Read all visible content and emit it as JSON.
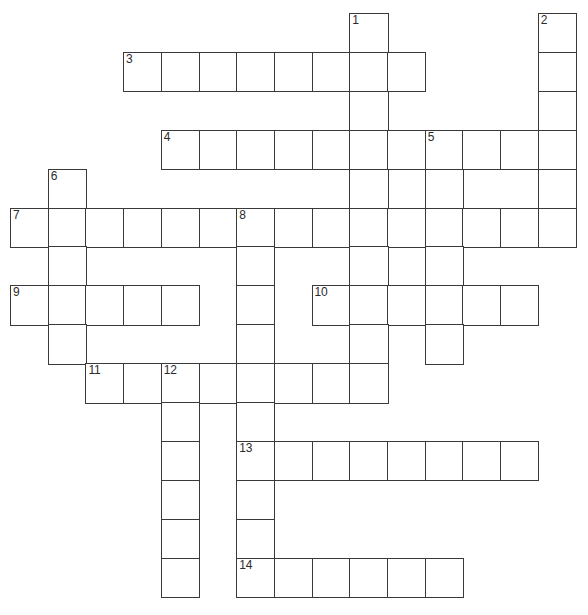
{
  "puzzle": {
    "title": "Crossword Puzzle Grid",
    "kind": "crossword-grid",
    "canvas": {
      "width": 588,
      "height": 615
    },
    "geometry": {
      "origin_x": 10,
      "origin_y": 13,
      "cell_width": 37.7,
      "cell_height": 38.9,
      "columns": 15,
      "rows": 16
    },
    "colors": {
      "background": "#ffffff",
      "cell_fill": "#ffffff",
      "cell_border": "#3a3a3a",
      "number_text": "#2b2b2b"
    },
    "numbered_clues": [
      {
        "number": "1",
        "col": 9,
        "row": 0,
        "direction": "down",
        "length": 10
      },
      {
        "number": "2",
        "col": 14,
        "row": 0,
        "direction": "down",
        "length": 6
      },
      {
        "number": "3",
        "col": 3,
        "row": 1,
        "direction": "across",
        "length": 8
      },
      {
        "number": "4",
        "col": 4,
        "row": 3,
        "direction": "across",
        "length": 7
      },
      {
        "number": "5",
        "col": 11,
        "row": 3,
        "direction": "across",
        "length": 4
      },
      {
        "number": "6",
        "col": 1,
        "row": 4,
        "direction": "down",
        "length": 6
      },
      {
        "number": "7",
        "col": 0,
        "row": 5,
        "direction": "across",
        "length": 15
      },
      {
        "number": "8",
        "col": 6,
        "row": 5,
        "direction": "down",
        "length": 10
      },
      {
        "number": "9",
        "col": 0,
        "row": 7,
        "direction": "across",
        "length": 5
      },
      {
        "number": "10",
        "col": 8,
        "row": 7,
        "direction": "across",
        "length": 6
      },
      {
        "number": "11",
        "col": 2,
        "row": 9,
        "direction": "across",
        "length": 2
      },
      {
        "number": "12",
        "col": 4,
        "row": 9,
        "direction": "across",
        "length": 6
      },
      {
        "number": "13",
        "col": 6,
        "row": 11,
        "direction": "across",
        "length": 8
      },
      {
        "number": "14",
        "col": 6,
        "row": 14,
        "direction": "across",
        "length": 6
      }
    ],
    "cells": [
      {
        "col": 9,
        "row": 0,
        "number": "1",
        "letter": ""
      },
      {
        "col": 14,
        "row": 0,
        "number": "2",
        "letter": ""
      },
      {
        "col": 3,
        "row": 1,
        "number": "3",
        "letter": ""
      },
      {
        "col": 4,
        "row": 1,
        "number": "",
        "letter": ""
      },
      {
        "col": 5,
        "row": 1,
        "number": "",
        "letter": ""
      },
      {
        "col": 6,
        "row": 1,
        "number": "",
        "letter": ""
      },
      {
        "col": 7,
        "row": 1,
        "number": "",
        "letter": ""
      },
      {
        "col": 8,
        "row": 1,
        "number": "",
        "letter": ""
      },
      {
        "col": 9,
        "row": 1,
        "number": "",
        "letter": ""
      },
      {
        "col": 10,
        "row": 1,
        "number": "",
        "letter": ""
      },
      {
        "col": 14,
        "row": 1,
        "number": "",
        "letter": ""
      },
      {
        "col": 9,
        "row": 2,
        "number": "",
        "letter": ""
      },
      {
        "col": 14,
        "row": 2,
        "number": "",
        "letter": ""
      },
      {
        "col": 4,
        "row": 3,
        "number": "4",
        "letter": ""
      },
      {
        "col": 5,
        "row": 3,
        "number": "",
        "letter": ""
      },
      {
        "col": 6,
        "row": 3,
        "number": "",
        "letter": ""
      },
      {
        "col": 7,
        "row": 3,
        "number": "",
        "letter": ""
      },
      {
        "col": 8,
        "row": 3,
        "number": "",
        "letter": ""
      },
      {
        "col": 9,
        "row": 3,
        "number": "",
        "letter": ""
      },
      {
        "col": 10,
        "row": 3,
        "number": "",
        "letter": ""
      },
      {
        "col": 11,
        "row": 3,
        "number": "5",
        "letter": ""
      },
      {
        "col": 12,
        "row": 3,
        "number": "",
        "letter": ""
      },
      {
        "col": 13,
        "row": 3,
        "number": "",
        "letter": ""
      },
      {
        "col": 14,
        "row": 3,
        "number": "",
        "letter": ""
      },
      {
        "col": 1,
        "row": 4,
        "number": "6",
        "letter": ""
      },
      {
        "col": 9,
        "row": 4,
        "number": "",
        "letter": ""
      },
      {
        "col": 11,
        "row": 4,
        "number": "",
        "letter": ""
      },
      {
        "col": 14,
        "row": 4,
        "number": "",
        "letter": ""
      },
      {
        "col": 0,
        "row": 5,
        "number": "7",
        "letter": ""
      },
      {
        "col": 1,
        "row": 5,
        "number": "",
        "letter": ""
      },
      {
        "col": 2,
        "row": 5,
        "number": "",
        "letter": ""
      },
      {
        "col": 3,
        "row": 5,
        "number": "",
        "letter": ""
      },
      {
        "col": 4,
        "row": 5,
        "number": "",
        "letter": ""
      },
      {
        "col": 5,
        "row": 5,
        "number": "",
        "letter": ""
      },
      {
        "col": 6,
        "row": 5,
        "number": "8",
        "letter": ""
      },
      {
        "col": 7,
        "row": 5,
        "number": "",
        "letter": ""
      },
      {
        "col": 8,
        "row": 5,
        "number": "",
        "letter": ""
      },
      {
        "col": 9,
        "row": 5,
        "number": "",
        "letter": ""
      },
      {
        "col": 10,
        "row": 5,
        "number": "",
        "letter": ""
      },
      {
        "col": 11,
        "row": 5,
        "number": "",
        "letter": ""
      },
      {
        "col": 12,
        "row": 5,
        "number": "",
        "letter": ""
      },
      {
        "col": 13,
        "row": 5,
        "number": "",
        "letter": ""
      },
      {
        "col": 14,
        "row": 5,
        "number": "",
        "letter": ""
      },
      {
        "col": 1,
        "row": 6,
        "number": "",
        "letter": ""
      },
      {
        "col": 6,
        "row": 6,
        "number": "",
        "letter": ""
      },
      {
        "col": 9,
        "row": 6,
        "number": "",
        "letter": ""
      },
      {
        "col": 11,
        "row": 6,
        "number": "",
        "letter": ""
      },
      {
        "col": 0,
        "row": 7,
        "number": "9",
        "letter": ""
      },
      {
        "col": 1,
        "row": 7,
        "number": "",
        "letter": ""
      },
      {
        "col": 2,
        "row": 7,
        "number": "",
        "letter": ""
      },
      {
        "col": 3,
        "row": 7,
        "number": "",
        "letter": ""
      },
      {
        "col": 4,
        "row": 7,
        "number": "",
        "letter": ""
      },
      {
        "col": 6,
        "row": 7,
        "number": "",
        "letter": ""
      },
      {
        "col": 8,
        "row": 7,
        "number": "10",
        "letter": ""
      },
      {
        "col": 9,
        "row": 7,
        "number": "",
        "letter": ""
      },
      {
        "col": 10,
        "row": 7,
        "number": "",
        "letter": ""
      },
      {
        "col": 11,
        "row": 7,
        "number": "",
        "letter": ""
      },
      {
        "col": 12,
        "row": 7,
        "number": "",
        "letter": ""
      },
      {
        "col": 13,
        "row": 7,
        "number": "",
        "letter": ""
      },
      {
        "col": 1,
        "row": 8,
        "number": "",
        "letter": ""
      },
      {
        "col": 6,
        "row": 8,
        "number": "",
        "letter": ""
      },
      {
        "col": 9,
        "row": 8,
        "number": "",
        "letter": ""
      },
      {
        "col": 11,
        "row": 8,
        "number": "",
        "letter": ""
      },
      {
        "col": 2,
        "row": 9,
        "number": "11",
        "letter": ""
      },
      {
        "col": 3,
        "row": 9,
        "number": "",
        "letter": ""
      },
      {
        "col": 4,
        "row": 9,
        "number": "12",
        "letter": ""
      },
      {
        "col": 5,
        "row": 9,
        "number": "",
        "letter": ""
      },
      {
        "col": 6,
        "row": 9,
        "number": "",
        "letter": ""
      },
      {
        "col": 7,
        "row": 9,
        "number": "",
        "letter": ""
      },
      {
        "col": 8,
        "row": 9,
        "number": "",
        "letter": ""
      },
      {
        "col": 9,
        "row": 9,
        "number": "",
        "letter": ""
      },
      {
        "col": 4,
        "row": 10,
        "number": "",
        "letter": ""
      },
      {
        "col": 6,
        "row": 10,
        "number": "",
        "letter": ""
      },
      {
        "col": 4,
        "row": 11,
        "number": "",
        "letter": ""
      },
      {
        "col": 6,
        "row": 11,
        "number": "13",
        "letter": ""
      },
      {
        "col": 7,
        "row": 11,
        "number": "",
        "letter": ""
      },
      {
        "col": 8,
        "row": 11,
        "number": "",
        "letter": ""
      },
      {
        "col": 9,
        "row": 11,
        "number": "",
        "letter": ""
      },
      {
        "col": 10,
        "row": 11,
        "number": "",
        "letter": ""
      },
      {
        "col": 11,
        "row": 11,
        "number": "",
        "letter": ""
      },
      {
        "col": 12,
        "row": 11,
        "number": "",
        "letter": ""
      },
      {
        "col": 13,
        "row": 11,
        "number": "",
        "letter": ""
      },
      {
        "col": 4,
        "row": 12,
        "number": "",
        "letter": ""
      },
      {
        "col": 6,
        "row": 12,
        "number": "",
        "letter": ""
      },
      {
        "col": 4,
        "row": 13,
        "number": "",
        "letter": ""
      },
      {
        "col": 6,
        "row": 13,
        "number": "",
        "letter": ""
      },
      {
        "col": 4,
        "row": 14,
        "number": "",
        "letter": ""
      },
      {
        "col": 6,
        "row": 14,
        "number": "14",
        "letter": ""
      },
      {
        "col": 7,
        "row": 14,
        "number": "",
        "letter": ""
      },
      {
        "col": 8,
        "row": 14,
        "number": "",
        "letter": ""
      },
      {
        "col": 9,
        "row": 14,
        "number": "",
        "letter": ""
      },
      {
        "col": 10,
        "row": 14,
        "number": "",
        "letter": ""
      },
      {
        "col": 11,
        "row": 14,
        "number": "",
        "letter": ""
      }
    ]
  }
}
